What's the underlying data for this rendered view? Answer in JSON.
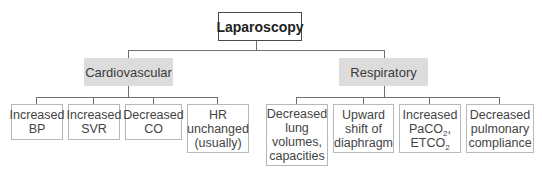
{
  "root": {
    "label": "Laparoscopy"
  },
  "categories": [
    {
      "label": "Cardiovascular",
      "effects": [
        {
          "lines": [
            "Increased",
            "BP"
          ]
        },
        {
          "lines": [
            "Increased",
            "SVR"
          ]
        },
        {
          "lines": [
            "Decreased",
            "CO"
          ]
        },
        {
          "lines": [
            "HR",
            "unchanged",
            "(usually)"
          ]
        }
      ]
    },
    {
      "label": "Respiratory",
      "effects": [
        {
          "lines": [
            "Decreased",
            "lung",
            "volumes,",
            "capacities"
          ]
        },
        {
          "lines": [
            "Upward",
            "shift of",
            "diaphragm"
          ]
        },
        {
          "lines": [
            "Increased",
            "PaCO",
            "2",
            ",",
            "ETCO",
            "2"
          ]
        },
        {
          "lines": [
            "Decreased",
            "pulmonary",
            "compliance"
          ]
        }
      ]
    }
  ],
  "colors": {
    "category_fill": "#dcdcdc",
    "line": "#6f6f6f",
    "leaf_border": "#b8b8b8"
  }
}
